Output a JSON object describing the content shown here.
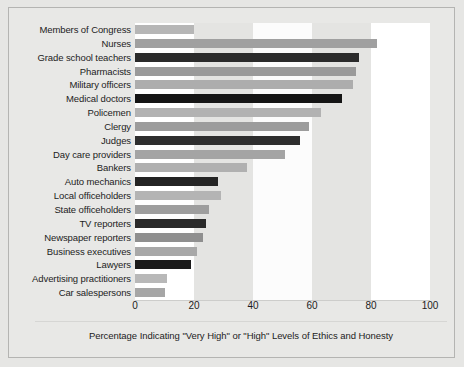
{
  "figure": {
    "caption": "Percentage Indicating \"Very High\" or \"High\" Levels of Ethics and Honesty",
    "background_color": "#e6e6e4",
    "frame_border_color": "#b4b4b2"
  },
  "chart_data": {
    "type": "bar",
    "orientation": "horizontal",
    "title": "",
    "xlabel": "Percentage Indicating \"Very High\" or \"High\" Levels of Ethics and Honesty",
    "ylabel": "",
    "xlim": [
      0,
      100
    ],
    "xticks": [
      0,
      20,
      40,
      60,
      80,
      100
    ],
    "xtick_labels": [
      "0",
      "20",
      "40",
      "60",
      "80",
      "100"
    ],
    "grid": false,
    "banding": "alternating vertical bands every 20 units, white then light gray",
    "legend": null,
    "categories": [
      "Members of Congress",
      "Nurses",
      "Grade school teachers",
      "Pharmacists",
      "Military officers",
      "Medical doctors",
      "Policemen",
      "Clergy",
      "Judges",
      "Day care providers",
      "Bankers",
      "Auto mechanics",
      "Local officeholders",
      "State officeholders",
      "TV reporters",
      "Newspaper reporters",
      "Business executives",
      "Lawyers",
      "Advertising practitioners",
      "Car salespersons"
    ],
    "values": [
      20,
      82,
      76,
      75,
      74,
      70,
      63,
      59,
      56,
      51,
      38,
      28,
      29,
      25,
      24,
      23,
      21,
      19,
      11,
      10
    ],
    "bar_colors": [
      "#b6b6b6",
      "#a0a0a0",
      "#2b2b2b",
      "#9a9a9a",
      "#adadad",
      "#151515",
      "#b2b2b2",
      "#9c9c9c",
      "#2e2e2e",
      "#a4a4a4",
      "#b0b0b0",
      "#242424",
      "#b4b4b4",
      "#9e9e9e",
      "#2a2a2a",
      "#8f8f8f",
      "#a8a8a8",
      "#1b1b1b",
      "#b8b8b8",
      "#a6a6a6"
    ],
    "bands": [
      {
        "from": 0,
        "to": 20,
        "color": "#ffffff"
      },
      {
        "from": 20,
        "to": 40,
        "color": "#e4e4e2"
      },
      {
        "from": 40,
        "to": 60,
        "color": "#fcfcfc"
      },
      {
        "from": 60,
        "to": 80,
        "color": "#e4e4e2"
      },
      {
        "from": 80,
        "to": 100,
        "color": "#ffffff"
      }
    ]
  }
}
